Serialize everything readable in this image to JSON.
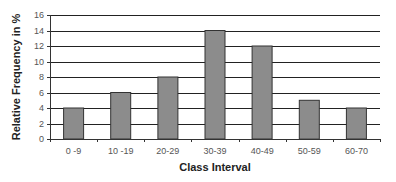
{
  "chart_data": {
    "type": "bar",
    "title": "",
    "xlabel": "Class Interval",
    "ylabel": "Relative Frequency in %",
    "categories": [
      "0 -9",
      "10 -19",
      "20-29",
      "30-39",
      "40-49",
      "50-59",
      "60-70"
    ],
    "values": [
      4,
      6,
      8,
      14,
      12,
      5,
      4
    ],
    "ylim": [
      0,
      16
    ],
    "yticks": [
      0,
      2,
      4,
      6,
      8,
      10,
      12,
      14,
      16
    ],
    "grid": true,
    "legend": null,
    "bar_color": "#8c8c8c",
    "bar_edge_color": "#333333",
    "grid_color": "#222222"
  }
}
